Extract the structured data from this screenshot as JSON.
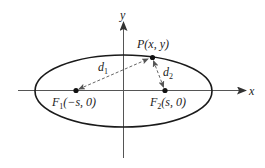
{
  "diagram": {
    "type": "ellipse-foci",
    "colors": {
      "axis": "#555555",
      "ellipse": "#1a1a1a",
      "dashed": "#666666",
      "point": "#111111",
      "text": "#222222"
    },
    "axes": {
      "x_label": "x",
      "y_label": "y"
    },
    "point_P": {
      "name": "P",
      "coords": "(x, y)"
    },
    "focus1": {
      "name": "F",
      "sub": "1",
      "coords": "(−s, 0)"
    },
    "focus2": {
      "name": "F",
      "sub": "2",
      "coords": "(s, 0)"
    },
    "d1": {
      "name": "d",
      "sub": "1"
    },
    "d2": {
      "name": "d",
      "sub": "2"
    }
  }
}
